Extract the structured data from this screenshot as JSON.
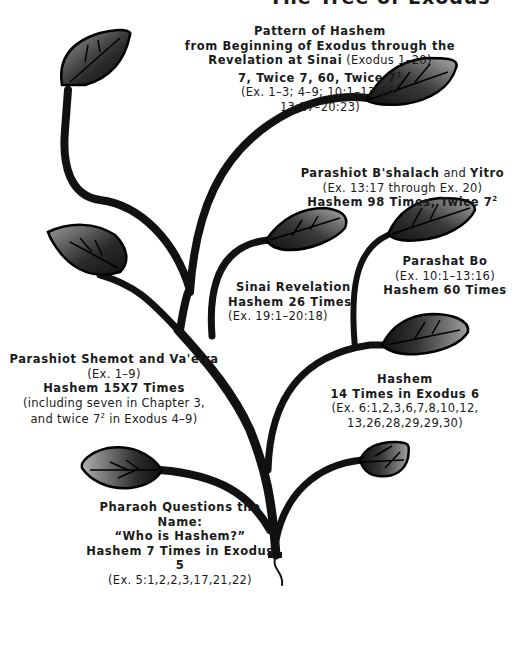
{
  "title": {
    "text": "The Tree of Exodus"
  },
  "colors": {
    "ink": "#111111",
    "leaf_dark": "#1a1a1a",
    "leaf_light": "#9a9a9a",
    "background": "#ffffff"
  },
  "labels": {
    "pattern": {
      "l1": "Pattern of Hashem",
      "l2": "from Beginning of Exodus through the",
      "l3a": "Revelation at Sinai",
      "l3b": "(Exodus 1–20)",
      "l4": "7, Twice 7, 60, Twice 7",
      "l4sup": "2",
      "l5": "(Ex. 1–3; 4–9; 10:1–13:16;",
      "l6": "13:17–20:23)"
    },
    "bshalach": {
      "l1a": "Parashiot B'shalach",
      "l1b": "and",
      "l1c": "Yitro",
      "l2": "(Ex. 13:17 through Ex. 20)",
      "l3": "Hashem 98 Times, Twice 7",
      "l3sup": "2"
    },
    "bo": {
      "l1": "Parashat Bo",
      "l2": "(Ex. 10:1–13:16)",
      "l3": "Hashem 60 Times"
    },
    "sinai": {
      "l1": "Sinai Revelation",
      "l2": "Hashem 26 Times",
      "l3": "(Ex. 19:1–20:18)"
    },
    "shemot": {
      "l1": "Parashiot Shemot and Va'eira",
      "l2": "(Ex. 1–9)",
      "l3": "Hashem 15X7 Times",
      "l4": "(including seven in Chapter 3,",
      "l5a": "and twice 7",
      "l5sup": "2",
      "l5b": "in Exodus 4–9)"
    },
    "exodus6": {
      "l1": "Hashem",
      "l2": "14 Times in Exodus 6",
      "l3": "(Ex. 6:1,2,3,6,7,8,10,12,",
      "l4": "13,26,28,29,29,30)"
    },
    "pharaoh": {
      "l1": "Pharaoh Questions the Name:",
      "l2": "“Who is Hashem?”",
      "l3": "Hashem 7 Times in Exodus 5",
      "l4": "(Ex. 5:1,2,2,3,17,21,22)"
    }
  }
}
